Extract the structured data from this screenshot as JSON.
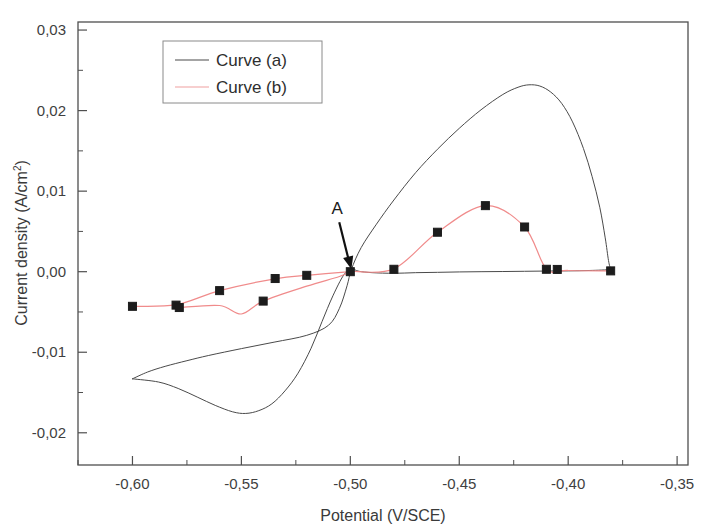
{
  "chart_data": {
    "type": "line",
    "title": "",
    "xlabel": "Potential (V/SCE)",
    "ylabel": "Current density (A/cm2)",
    "ylabel_main": "Current density (A/cm",
    "ylabel_sup": "2",
    "ylabel_tail": ")",
    "xlim": [
      -0.625,
      -0.345
    ],
    "ylim": [
      -0.024,
      0.031
    ],
    "grid": false,
    "legend_position": "top-left-inside",
    "xticks": [
      -0.6,
      -0.55,
      -0.5,
      -0.45,
      -0.4,
      -0.35
    ],
    "xticklabels": [
      "-0,60",
      "-0,55",
      "-0,50",
      "-0,45",
      "-0,40",
      "-0,35"
    ],
    "xminorticks": [
      -0.625,
      -0.575,
      -0.525,
      -0.475,
      -0.425,
      -0.375
    ],
    "yticks": [
      0.03,
      0.02,
      0.01,
      0.0,
      -0.01,
      -0.02
    ],
    "yticklabels": [
      "0,03",
      "0,02",
      "0,01",
      "0,00",
      "-0,01",
      "-0,02"
    ],
    "yminorticks": [
      0.025,
      0.015,
      0.005,
      -0.005,
      -0.015
    ],
    "annotations": [
      {
        "text": "A",
        "x": -0.506,
        "y": 0.0044,
        "arrow_to_x": -0.4995,
        "arrow_to_y": 0.0003,
        "description": "arrow pointing to curve crossover point"
      }
    ],
    "series": [
      {
        "name": "Curve (a)",
        "label": "Curve (a)",
        "color": "#4a4a4a",
        "marker": "none",
        "linewidth": 1,
        "description": "cyclic voltammogram, anodic peak near -0.418 V at 0.0232 A/cm2 and cathodic loop minimum near -0.548 V at -0.0176 A/cm2",
        "forward_points": [
          [
            -0.6,
            -0.0133
          ],
          [
            -0.593,
            -0.01245
          ],
          [
            -0.585,
            -0.01175
          ],
          [
            -0.575,
            -0.01105
          ],
          [
            -0.565,
            -0.0104
          ],
          [
            -0.55,
            -0.00955
          ],
          [
            -0.535,
            -0.00875
          ],
          [
            -0.52,
            -0.0079
          ],
          [
            -0.51,
            -0.00665
          ],
          [
            -0.505,
            -0.00455
          ],
          [
            -0.5015,
            -0.00175
          ],
          [
            -0.4995,
            0.0003
          ],
          [
            -0.495,
            0.003
          ],
          [
            -0.488,
            0.0059
          ],
          [
            -0.48,
            0.0089
          ],
          [
            -0.47,
            0.0123
          ],
          [
            -0.46,
            0.0152
          ],
          [
            -0.45,
            0.0178
          ],
          [
            -0.44,
            0.0201
          ],
          [
            -0.43,
            0.022
          ],
          [
            -0.423,
            0.0229
          ],
          [
            -0.418,
            0.0232
          ],
          [
            -0.413,
            0.02305
          ],
          [
            -0.408,
            0.0223
          ],
          [
            -0.403,
            0.0209
          ],
          [
            -0.398,
            0.0186
          ],
          [
            -0.393,
            0.0153
          ],
          [
            -0.389,
            0.0118
          ],
          [
            -0.3855,
            0.008
          ],
          [
            -0.383,
            0.0042
          ],
          [
            -0.3815,
            0.0014
          ],
          [
            -0.3805,
            0.00025
          ]
        ],
        "reverse_points": [
          [
            -0.3805,
            0.00025
          ],
          [
            -0.39,
            0.00015
          ],
          [
            -0.4,
            0.0001
          ],
          [
            -0.41,
            8e-05
          ],
          [
            -0.42,
            5e-05
          ],
          [
            -0.43,
            2e-05
          ],
          [
            -0.44,
            0.0
          ],
          [
            -0.45,
            -3e-05
          ],
          [
            -0.46,
            -8e-05
          ],
          [
            -0.47,
            -0.00012
          ],
          [
            -0.48,
            -0.0002
          ],
          [
            -0.49,
            -0.00012
          ],
          [
            -0.496,
            5e-05
          ],
          [
            -0.4995,
            0.0003
          ],
          [
            -0.503,
            -0.0004
          ],
          [
            -0.508,
            -0.003
          ],
          [
            -0.513,
            -0.0062
          ],
          [
            -0.518,
            -0.0095
          ],
          [
            -0.524,
            -0.0126
          ],
          [
            -0.53,
            -0.0148
          ],
          [
            -0.536,
            -0.0164
          ],
          [
            -0.542,
            -0.01725
          ],
          [
            -0.548,
            -0.0176
          ],
          [
            -0.554,
            -0.0174
          ],
          [
            -0.562,
            -0.0166
          ],
          [
            -0.57,
            -0.0156
          ],
          [
            -0.579,
            -0.0145
          ],
          [
            -0.588,
            -0.0137
          ],
          [
            -0.6,
            -0.0133
          ]
        ]
      },
      {
        "name": "Curve (b)",
        "label": "Curve (b)",
        "color": "#f08b8b",
        "marker": "square",
        "marker_color": "#1c1c1c",
        "linewidth": 1.2,
        "description": "cyclic voltammogram with square data markers, anodic peak near -0.438 V at 0.0082 A/cm2",
        "forward_points": [
          [
            -0.6,
            -0.0043
          ],
          [
            -0.58,
            -0.00415
          ],
          [
            -0.578,
            -0.0044
          ],
          [
            -0.56,
            -0.00235
          ],
          [
            -0.54,
            -0.00365
          ],
          [
            -0.535,
            -0.00085
          ],
          [
            -0.52,
            -0.00045
          ],
          [
            -0.5,
            5e-05
          ],
          [
            -0.48,
            0.00035
          ],
          [
            -0.46,
            0.0049
          ],
          [
            -0.438,
            0.0082
          ],
          [
            -0.42,
            0.00555
          ],
          [
            -0.41,
            0.00035
          ],
          [
            -0.4,
            0.00015
          ],
          [
            -0.3805,
            0.0001
          ]
        ],
        "markers": [
          [
            -0.6,
            -0.0043
          ],
          [
            -0.58,
            -0.00415
          ],
          [
            -0.5785,
            -0.00445
          ],
          [
            -0.56,
            -0.00235
          ],
          [
            -0.54,
            -0.00365
          ],
          [
            -0.5345,
            -0.00085
          ],
          [
            -0.52,
            -0.00045
          ],
          [
            -0.5,
            0.0
          ],
          [
            -0.48,
            0.0003
          ],
          [
            -0.46,
            0.0049
          ],
          [
            -0.438,
            0.0082
          ],
          [
            -0.42,
            0.00555
          ],
          [
            -0.41,
            0.0003
          ],
          [
            -0.405,
            0.00028
          ],
          [
            -0.3805,
            0.0001
          ]
        ],
        "upper_branch": [
          [
            -0.6,
            -0.0043
          ],
          [
            -0.58,
            -0.0041
          ],
          [
            -0.56,
            -0.00235
          ],
          [
            -0.534,
            -0.00085
          ],
          [
            -0.52,
            -0.00045
          ],
          [
            -0.5,
            0.0
          ]
        ],
        "lower_branch": [
          [
            -0.5785,
            -0.00445
          ],
          [
            -0.56,
            -0.0042
          ],
          [
            -0.55,
            -0.00525
          ],
          [
            -0.54,
            -0.00365
          ],
          [
            -0.52,
            -0.0018
          ],
          [
            -0.505,
            -0.0006
          ],
          [
            -0.5,
            0.0
          ]
        ]
      }
    ]
  },
  "legend": {
    "entries": [
      {
        "label": "Curve (a)",
        "color": "#4a4a4a"
      },
      {
        "label": "Curve (b)",
        "color": "#f0a0a0"
      }
    ]
  },
  "axes": {
    "x_title": "Potential (V/SCE)",
    "y_title_main": "Current density (A/cm",
    "y_title_sup": "2",
    "y_title_tail": ")"
  },
  "colors": {
    "frame": "#4f4f4f",
    "curve_a": "#4a4a4a",
    "curve_b": "#f08b8b",
    "marker": "#1c1c1c",
    "text": "#3a3a3a",
    "background": "#ffffff"
  }
}
